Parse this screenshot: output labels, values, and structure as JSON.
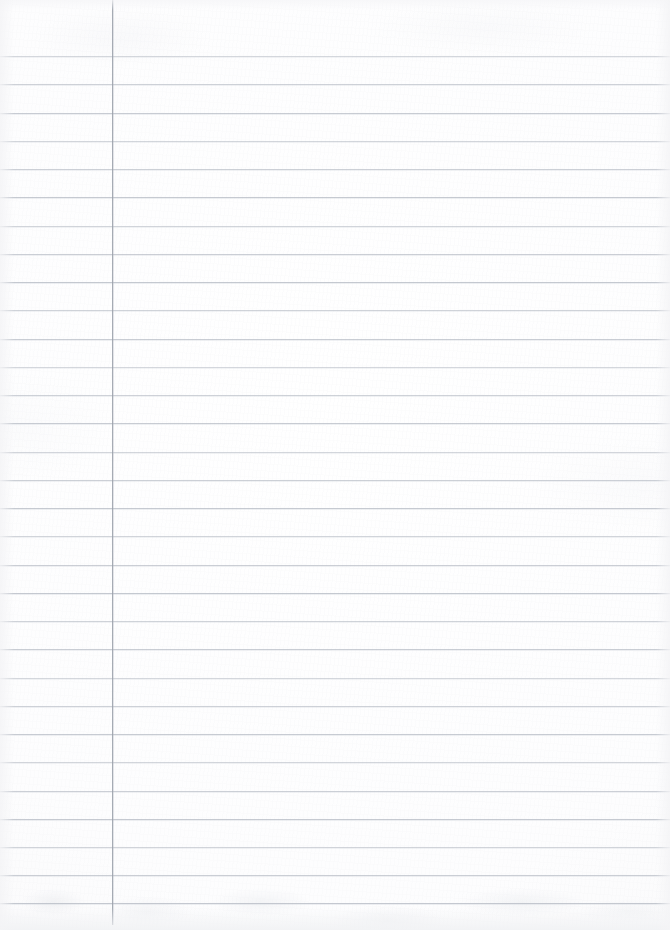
{
  "document": {
    "kind": "ruled-notebook-paper",
    "title": "Blank Ruled Notebook Page",
    "content_text": "",
    "page_width": 670,
    "page_height": 930,
    "background_color": "#fdfdfd",
    "has_handwriting": false,
    "has_printed_text": false
  },
  "ruling": {
    "horizontal_line_color": "#b9bec7",
    "horizontal_line_thickness": 1,
    "first_line_y": 56,
    "line_spacing": 28.25,
    "line_count": 31,
    "line_left_x": 0,
    "line_right_x": 670,
    "line_y_positions": [
      56,
      84,
      113,
      141,
      169,
      197,
      226,
      254,
      282,
      310,
      339,
      367,
      395,
      423,
      452,
      480,
      508,
      536,
      565,
      593,
      621,
      649,
      678,
      706,
      734,
      762,
      791,
      819,
      847,
      875,
      903
    ]
  },
  "margin": {
    "vertical_line_color": "#9aa0aa",
    "vertical_line_thickness": 1,
    "vertical_line_x": 112,
    "vertical_line_top_y": 0,
    "vertical_line_bottom_y": 925,
    "left_column_width": 112
  },
  "writing_area": {
    "left": 112,
    "top": 0,
    "right": 670,
    "bottom": 925,
    "is_empty": true
  },
  "labels": {
    "page_name": "page-sheet",
    "margin_name": "margin-rule",
    "rule_name": "ruled-line"
  }
}
